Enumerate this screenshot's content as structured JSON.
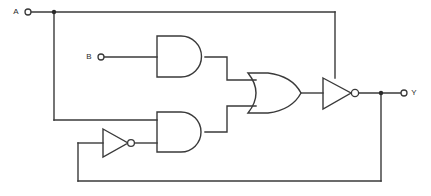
{
  "diagram": {
    "type": "digital-logic-schematic",
    "background_color": "#ffffff",
    "line_color": "#3a3a3a",
    "label_color": "#2b2b2b"
  },
  "ports": {
    "input_a": {
      "label": "A",
      "label_x": 16,
      "label_y": 12,
      "terminal_cx": 28,
      "terminal_cy": 12,
      "terminal_r": 3
    },
    "input_b": {
      "label": "B",
      "label_x": 88,
      "label_y": 57,
      "terminal_cx": 101,
      "terminal_cy": 57,
      "terminal_r": 3
    },
    "output_y": {
      "label": "Y",
      "label_x": 412,
      "label_y": 93,
      "terminal_cx": 404,
      "terminal_cy": 93,
      "terminal_r": 3
    }
  },
  "gates": [
    {
      "name": "and-gate-top",
      "type": "AND",
      "x": 157,
      "y": 36,
      "width": 48,
      "height": 41,
      "inputs": [
        {
          "name": "b-input",
          "x": 157,
          "y": 57
        }
      ],
      "output": {
        "x": 205,
        "y": 57
      }
    },
    {
      "name": "and-gate-bottom",
      "type": "AND",
      "x": 157,
      "y": 112,
      "width": 48,
      "height": 40,
      "inputs": [
        {
          "name": "a-feedback-input",
          "x": 157,
          "y": 120
        },
        {
          "name": "inverted-y-input",
          "x": 157,
          "y": 143
        }
      ],
      "output": {
        "x": 205,
        "y": 132
      }
    },
    {
      "name": "or-gate",
      "type": "OR",
      "x": 248,
      "y": 73,
      "width": 53,
      "height": 40,
      "inputs": [
        {
          "name": "from-and-top",
          "x": 255,
          "y": 80
        },
        {
          "name": "from-and-bottom",
          "x": 255,
          "y": 106
        }
      ],
      "output": {
        "x": 301,
        "y": 93
      }
    },
    {
      "name": "not-gate-output",
      "type": "NOT",
      "x": 323,
      "y": 78,
      "width": 29,
      "height": 31,
      "bubble_cx": 355,
      "bubble_cy": 93,
      "bubble_r": 3.6,
      "inputs": [
        {
          "name": "from-or-gate",
          "x": 323,
          "y": 93
        },
        {
          "name": "from-a-top",
          "x": 335,
          "y": 78
        }
      ],
      "output": {
        "x": 358,
        "y": 93
      }
    },
    {
      "name": "not-gate-feedback",
      "type": "NOT",
      "x": 103,
      "y": 129,
      "width": 25,
      "height": 28,
      "bubble_cx": 131,
      "bubble_cy": 143,
      "bubble_r": 3.4,
      "inputs": [
        {
          "name": "from-y-feedback",
          "x": 103,
          "y": 143
        }
      ],
      "output": {
        "x": 134,
        "y": 143
      }
    }
  ],
  "wires": [
    {
      "name": "wire-a-to-top-bus",
      "d": "M 31 12 L 335 12"
    },
    {
      "name": "wire-a-top-bus-down",
      "d": "M 335 12 L 335 78"
    },
    {
      "name": "wire-a-branch-down",
      "d": "M 54 12 L 54 120"
    },
    {
      "name": "wire-a-branch-to-and",
      "d": "M 54 120 L 157 120"
    },
    {
      "name": "wire-b-to-and",
      "d": "M 104 57 L 157 57"
    },
    {
      "name": "wire-and-top-to-or",
      "d": "M 205 57 L 227 57 L 227 80 L 256 80"
    },
    {
      "name": "wire-and-bottom-to-or",
      "d": "M 205 132 L 227 132 L 227 106 L 256 106"
    },
    {
      "name": "wire-or-to-not",
      "d": "M 301 93 L 323 93"
    },
    {
      "name": "wire-not-to-y",
      "d": "M 358 93 L 401 93"
    },
    {
      "name": "wire-y-feedback-down",
      "d": "M 381 93 L 381 181"
    },
    {
      "name": "wire-y-feedback-left",
      "d": "M 381 181 L 78 181"
    },
    {
      "name": "wire-y-feedback-up",
      "d": "M 78 181 L 78 143"
    },
    {
      "name": "wire-y-feedback-to-not",
      "d": "M 78 143 L 103 143"
    },
    {
      "name": "wire-not-fb-to-and",
      "d": "M 134 143 L 157 143"
    }
  ],
  "junctions": [
    {
      "name": "junction-a-split",
      "cx": 54,
      "cy": 12,
      "r": 2.2
    },
    {
      "name": "junction-y-split",
      "cx": 381,
      "cy": 93,
      "r": 2.2
    }
  ]
}
